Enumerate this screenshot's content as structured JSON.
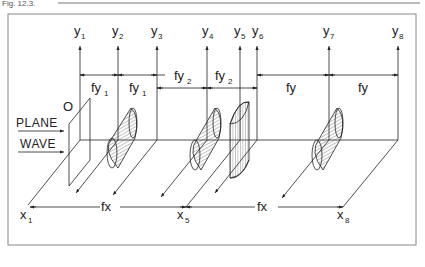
{
  "caption": "Fig. 12.3.",
  "axes_y": [
    {
      "id": "y1",
      "base": "y",
      "sub": "1"
    },
    {
      "id": "y2",
      "base": "y",
      "sub": "2"
    },
    {
      "id": "y3",
      "base": "y",
      "sub": "3"
    },
    {
      "id": "y4",
      "base": "y",
      "sub": "4"
    },
    {
      "id": "y5",
      "base": "y",
      "sub": "5"
    },
    {
      "id": "y6",
      "base": "y",
      "sub": "6"
    },
    {
      "id": "y7",
      "base": "y",
      "sub": "7"
    },
    {
      "id": "y8",
      "base": "y",
      "sub": "8"
    }
  ],
  "axes_x": [
    {
      "id": "x1",
      "base": "x",
      "sub": "1"
    },
    {
      "id": "x5",
      "base": "x",
      "sub": "5"
    },
    {
      "id": "x8",
      "base": "x",
      "sub": "8"
    }
  ],
  "dimensions_top": [
    {
      "base": "fy",
      "sub": "1"
    },
    {
      "base": "fy",
      "sub": "1"
    },
    {
      "base": "fy",
      "sub": "2"
    },
    {
      "base": "fy",
      "sub": "2"
    },
    {
      "base": "fy",
      "sub": ""
    },
    {
      "base": "fy",
      "sub": ""
    }
  ],
  "dimensions_bottom": [
    {
      "base": "fx"
    },
    {
      "base": "fx"
    }
  ],
  "input": {
    "plane_label": "O",
    "line1": "PLANE",
    "line2": "WAVE"
  }
}
